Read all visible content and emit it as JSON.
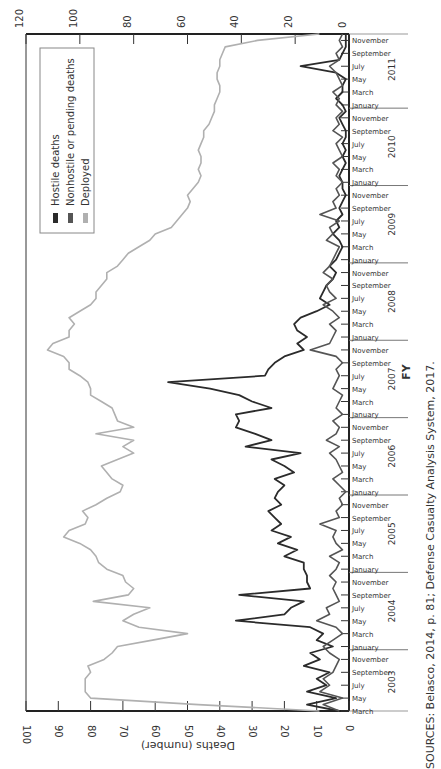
{
  "chart_data": {
    "type": "line",
    "orientation": "rotated-90-clockwise",
    "title": "",
    "xlabel": "FY",
    "ylabel": "Deaths (number)",
    "y2label": "Deployed (thousands)",
    "ylim": [
      0,
      100
    ],
    "y2lim": [
      0,
      120
    ],
    "yticks": [
      0,
      10,
      20,
      30,
      40,
      50,
      60,
      70,
      80,
      90,
      100
    ],
    "y2ticks": [
      0,
      20,
      40,
      60,
      80,
      100,
      120
    ],
    "fiscal_years": [
      "2003",
      "2004",
      "2005",
      "2006",
      "2007",
      "2008",
      "2009",
      "2010",
      "2011"
    ],
    "month_labels": [
      "January",
      "March",
      "May",
      "July",
      "September",
      "November"
    ],
    "fy2003_month_labels": [
      "March",
      "May",
      "July",
      "September",
      "November"
    ],
    "legend": [
      {
        "name": "Hostile deaths",
        "color": "#2b2b2b"
      },
      {
        "name": "Nonhostile or pending deaths",
        "color": "#555555"
      },
      {
        "name": "Deployed",
        "color": "#b0b0b0"
      }
    ],
    "x": [
      "2003-03",
      "2003-04",
      "2003-05",
      "2003-06",
      "2003-07",
      "2003-08",
      "2003-09",
      "2003-10",
      "2003-11",
      "2003-12",
      "2004-01",
      "2004-02",
      "2004-03",
      "2004-04",
      "2004-05",
      "2004-06",
      "2004-07",
      "2004-08",
      "2004-09",
      "2004-10",
      "2004-11",
      "2004-12",
      "2005-01",
      "2005-02",
      "2005-03",
      "2005-04",
      "2005-05",
      "2005-06",
      "2005-07",
      "2005-08",
      "2005-09",
      "2005-10",
      "2005-11",
      "2005-12",
      "2006-01",
      "2006-02",
      "2006-03",
      "2006-04",
      "2006-05",
      "2006-06",
      "2006-07",
      "2006-08",
      "2006-09",
      "2006-10",
      "2006-11",
      "2006-12",
      "2007-01",
      "2007-02",
      "2007-03",
      "2007-04",
      "2007-05",
      "2007-06",
      "2007-07",
      "2007-08",
      "2007-09",
      "2007-10",
      "2007-11",
      "2007-12",
      "2008-01",
      "2008-02",
      "2008-03",
      "2008-04",
      "2008-05",
      "2008-06",
      "2008-07",
      "2008-08",
      "2008-09",
      "2008-10",
      "2008-11",
      "2008-12",
      "2009-01",
      "2009-02",
      "2009-03",
      "2009-04",
      "2009-05",
      "2009-06",
      "2009-07",
      "2009-08",
      "2009-09",
      "2009-10",
      "2009-11",
      "2009-12",
      "2010-01",
      "2010-02",
      "2010-03",
      "2010-04",
      "2010-05",
      "2010-06",
      "2010-07",
      "2010-08",
      "2010-09",
      "2010-10",
      "2010-11",
      "2010-12",
      "2011-01",
      "2011-02",
      "2011-03",
      "2011-04",
      "2011-05",
      "2011-06",
      "2011-07",
      "2011-08",
      "2011-09",
      "2011-10",
      "2011-11",
      "2011-12"
    ],
    "series": [
      {
        "name": "Hostile deaths",
        "values": [
          3,
          13,
          4,
          13,
          7,
          10,
          6,
          14,
          9,
          12,
          5,
          10,
          8,
          12,
          35,
          20,
          18,
          14,
          34,
          12,
          13,
          13,
          14,
          14,
          20,
          16,
          22,
          18,
          24,
          21,
          23,
          25,
          21,
          23,
          22,
          20,
          23,
          17,
          20,
          24,
          15,
          32,
          24,
          29,
          35,
          34,
          35,
          24,
          30,
          34,
          43,
          56,
          26,
          25,
          23,
          20,
          14,
          16,
          13,
          16,
          17,
          15,
          10,
          6,
          9,
          8,
          7,
          5,
          4,
          6,
          4,
          3,
          2,
          3,
          5,
          3,
          4,
          2,
          3,
          2,
          1,
          2,
          2,
          3,
          2,
          1,
          2,
          1,
          2,
          1,
          1,
          2,
          3,
          1,
          2,
          4,
          2,
          2,
          1,
          4,
          15,
          3,
          2,
          1,
          1,
          1
        ]
      },
      {
        "name": "Nonhostile or pending deaths",
        "values": [
          3,
          8,
          2,
          9,
          6,
          8,
          5,
          4,
          3,
          6,
          8,
          5,
          2,
          4,
          10,
          6,
          7,
          3,
          4,
          5,
          4,
          6,
          4,
          3,
          6,
          2,
          4,
          5,
          4,
          9,
          3,
          4,
          2,
          3,
          1,
          3,
          5,
          2,
          3,
          4,
          6,
          3,
          7,
          4,
          3,
          5,
          2,
          4,
          3,
          2,
          5,
          4,
          3,
          4,
          2,
          4,
          12,
          6,
          5,
          4,
          6,
          3,
          5,
          8,
          4,
          6,
          7,
          5,
          8,
          6,
          5,
          4,
          3,
          7,
          5,
          6,
          3,
          9,
          4,
          5,
          3,
          4,
          2,
          4,
          3,
          5,
          2,
          3,
          4,
          2,
          5,
          3,
          4,
          2,
          4,
          3,
          5,
          2,
          3,
          4,
          6,
          3,
          4,
          2,
          3,
          2
        ]
      },
      {
        "name": "Deployed (thousands)",
        "axis": "y2",
        "values": [
          11,
          56,
          96,
          98,
          98,
          98,
          96,
          97,
          91,
          88,
          86,
          73,
          60,
          78,
          84,
          80,
          74,
          95,
          82,
          80,
          83,
          84,
          90,
          93,
          94,
          96,
          100,
          106,
          104,
          98,
          97,
          99,
          94,
          90,
          85,
          84,
          88,
          90,
          92,
          86,
          80,
          84,
          80,
          94,
          80,
          86,
          87,
          88,
          92,
          96,
          96,
          97,
          100,
          104,
          104,
          106,
          112,
          110,
          104,
          104,
          102,
          104,
          100,
          96,
          94,
          94,
          92,
          90,
          90,
          86,
          84,
          82,
          78,
          74,
          72,
          66,
          64,
          62,
          60,
          59,
          60,
          58,
          56,
          55,
          56,
          55,
          55,
          56,
          55,
          54,
          54,
          52,
          51,
          50,
          50,
          49,
          48,
          48,
          49,
          49,
          48,
          48,
          47,
          46,
          34,
          11
        ]
      }
    ],
    "grid": false,
    "legend_position": "upper-left (rotated frame)",
    "source": "SOURCES: Belasco, 2014, p. 81; Defense Casualty Analysis System, 2017."
  }
}
